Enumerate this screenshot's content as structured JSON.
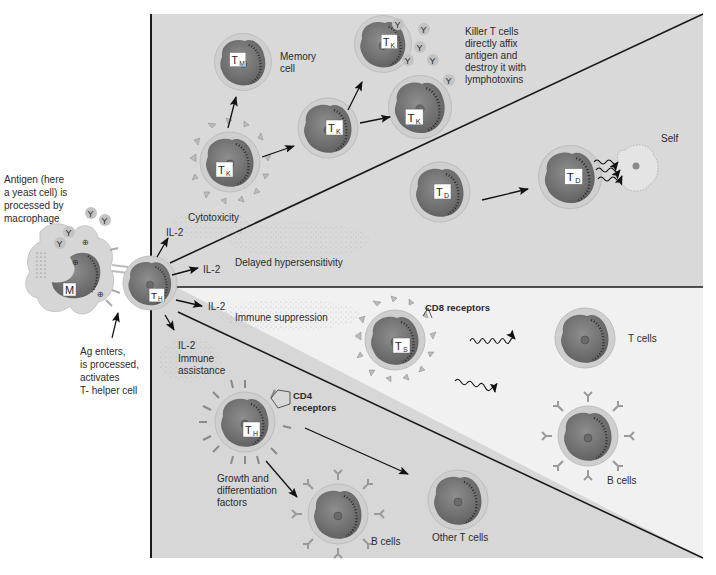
{
  "diagram": {
    "colors": {
      "panel_upper": "#d9d9d9",
      "panel_lower_light": "#f1f1f1",
      "panel_lower_dark": "#d7d7d7",
      "cell_membrane": "#c9c9c9",
      "cell_nucleus": "#7a7a7a",
      "line": "#1a1a1a",
      "background": "#ffffff"
    },
    "left_labels": {
      "antigen_line1": "Antigen (here",
      "antigen_line2": "a yeast cell) is",
      "antigen_line3": "processed by",
      "antigen_line4": "macrophage",
      "ag_line1": "Ag enters,",
      "ag_line2": "is processed,",
      "ag_line3": "activates",
      "ag_line4": "T- helper cell"
    },
    "macrophage": {
      "label": "M",
      "antigen_glyph": "Y",
      "plus_glyph": "⊕"
    },
    "helper_cell": {
      "label": "T",
      "subscript": "H"
    },
    "il2": {
      "cytotoxicity": "IL-2",
      "delayed": "IL-2",
      "suppression": "IL-2",
      "assistance": "IL-2"
    },
    "pathways": {
      "cytotoxicity": "Cytotoxicity",
      "delayed": "Delayed hypersensitivity",
      "suppression": "Immune suppression",
      "assistance_line1": "Immune",
      "assistance_line2": "assistance"
    },
    "cytotoxic_section": {
      "memory_label_line1": "Memory",
      "memory_label_line2": "cell",
      "memory_cell": {
        "label": "T",
        "subscript": "M"
      },
      "killer_cells": [
        {
          "label": "T",
          "subscript": "K"
        },
        {
          "label": "T",
          "subscript": "K"
        },
        {
          "label": "T",
          "subscript": "K"
        },
        {
          "label": "T",
          "subscript": "K"
        }
      ],
      "killer_note_line1": "Killer T cells",
      "killer_note_line2": "directly affix",
      "killer_note_line3": "antigen and",
      "killer_note_line4": "destroy it with",
      "killer_note_line5": "lymphotoxins",
      "antigen_glyph": "Y"
    },
    "delayed_section": {
      "cells": [
        {
          "label": "T",
          "subscript": "D"
        },
        {
          "label": "T",
          "subscript": "D"
        }
      ],
      "self_label": "Self"
    },
    "suppression_section": {
      "suppressor_cell": {
        "label": "T",
        "subscript": "S"
      },
      "cd8_label": "CD8 receptors",
      "t_cells_label": "T cells",
      "b_cells_label": "B cells"
    },
    "assistance_section": {
      "helper_cell": {
        "label": "T",
        "subscript": "H"
      },
      "cd4_label_line1": "CD4",
      "cd4_label_line2": "receptors",
      "growth_line1": "Growth and",
      "growth_line2": "differentiation",
      "growth_line3": "factors",
      "b_cells_label": "B cells",
      "other_t_cells_label": "Other T cells"
    }
  }
}
